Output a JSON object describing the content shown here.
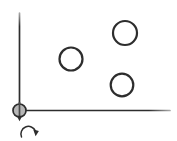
{
  "canvas": {
    "width": 177,
    "height": 141,
    "background": "#ffffff"
  },
  "colors": {
    "ink": "#2d2d2d",
    "ink_faint": "#a8a8a8",
    "pivot_fill": "#b7b7b7",
    "pivot_core": "#4a4a4a"
  },
  "stroke": {
    "axis_width": 1.7,
    "circle_width": 2.2,
    "arrow_width": 1.5,
    "pin_width": 1.7
  },
  "axes": {
    "vertical": {
      "x": 19.5,
      "y_top": 13,
      "y_bottom": 110.5
    },
    "horizontal": {
      "y": 110.5,
      "x_left": 19.5,
      "x_right": 170
    }
  },
  "pivot": {
    "cx": 19.5,
    "cy": 110.5,
    "r": 6.5,
    "pin_y1": 102.5,
    "pin_y2": 116.5,
    "arrowhead_points": "16.7,115.8 22.3,115.8 19.5,121.2"
  },
  "rotation_arrow": {
    "arc_path": "M 21.5 137 A 7.5 7.5 0 0 1 35.5 131",
    "arrowhead_points": "33.2,129.6 38.9,131.1 35.6,136.3"
  },
  "circles": [
    {
      "cx": 71,
      "cy": 59,
      "r": 11.5
    },
    {
      "cx": 125,
      "cy": 33,
      "r": 12.0
    },
    {
      "cx": 122,
      "cy": 85,
      "r": 11.3
    }
  ]
}
